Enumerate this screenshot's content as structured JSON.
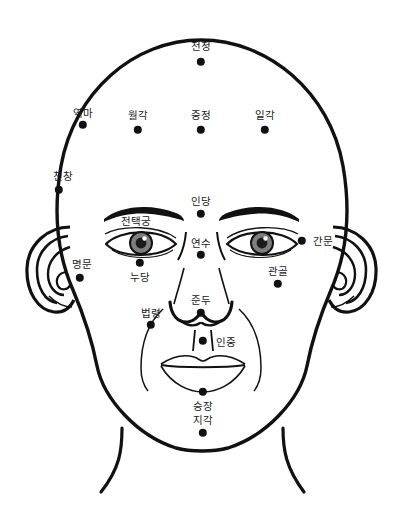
{
  "diagram": {
    "type": "anatomical-line-drawing",
    "canvas": {
      "width": 403,
      "height": 512
    },
    "colors": {
      "background": "#ffffff",
      "outline": "#111111",
      "dot": "#111111",
      "label_text": "#1a1a1a",
      "iris": "#7a7a7a",
      "pupil": "#1a1a1a"
    },
    "points": [
      {
        "id": "cheonjeong",
        "label": "천정",
        "dot": {
          "x": 201,
          "y": 62
        },
        "label_pos": {
          "x": 201,
          "y": 46
        },
        "radius": 4.2
      },
      {
        "id": "yeokma",
        "label": "역마",
        "dot": {
          "x": 83,
          "y": 125
        },
        "label_pos": {
          "x": 83,
          "y": 113
        },
        "radius": 4.2
      },
      {
        "id": "wolgak",
        "label": "월각",
        "dot": {
          "x": 138,
          "y": 130
        },
        "label_pos": {
          "x": 138,
          "y": 115
        },
        "radius": 4.2
      },
      {
        "id": "jungjeong",
        "label": "중정",
        "dot": {
          "x": 201,
          "y": 130
        },
        "label_pos": {
          "x": 201,
          "y": 115
        },
        "radius": 4.2
      },
      {
        "id": "ilgak",
        "label": "일각",
        "dot": {
          "x": 265,
          "y": 130
        },
        "label_pos": {
          "x": 265,
          "y": 115
        },
        "radius": 4.2
      },
      {
        "id": "cheonchang",
        "label": "천창",
        "dot": {
          "x": 59,
          "y": 190
        },
        "label_pos": {
          "x": 63,
          "y": 176
        },
        "radius": 4.2
      },
      {
        "id": "indang",
        "label": "인당",
        "dot": {
          "x": 201,
          "y": 214
        },
        "label_pos": {
          "x": 201,
          "y": 201
        },
        "radius": 4.2
      },
      {
        "id": "jeontaekgung",
        "label": "전택궁",
        "dot": null,
        "label_pos": {
          "x": 136,
          "y": 221
        },
        "radius": 0
      },
      {
        "id": "yeonsu",
        "label": "연수",
        "dot": {
          "x": 201,
          "y": 255
        },
        "label_pos": {
          "x": 201,
          "y": 243
        },
        "radius": 4.2
      },
      {
        "id": "ganmun",
        "label": "간문",
        "dot": {
          "x": 302,
          "y": 241
        },
        "label_pos": {
          "x": 323,
          "y": 241
        },
        "radius": 4.2
      },
      {
        "id": "myeongmun",
        "label": "명문",
        "dot": {
          "x": 80,
          "y": 278
        },
        "label_pos": {
          "x": 82,
          "y": 264
        },
        "radius": 4.2
      },
      {
        "id": "nudang",
        "label": "누당",
        "dot": {
          "x": 140,
          "y": 263
        },
        "label_pos": {
          "x": 140,
          "y": 277
        },
        "radius": 4.2
      },
      {
        "id": "gwangol",
        "label": "관골",
        "dot": {
          "x": 278,
          "y": 284
        },
        "label_pos": {
          "x": 278,
          "y": 271
        },
        "radius": 4.2
      },
      {
        "id": "jundu",
        "label": "준두",
        "dot": {
          "x": 201,
          "y": 313
        },
        "label_pos": {
          "x": 201,
          "y": 300
        },
        "radius": 4.2
      },
      {
        "id": "beopryeong",
        "label": "법령",
        "dot": {
          "x": 151,
          "y": 325
        },
        "label_pos": {
          "x": 151,
          "y": 313
        },
        "radius": 4.2
      },
      {
        "id": "injung",
        "label": "인중",
        "dot": {
          "x": 203,
          "y": 341
        },
        "label_pos": {
          "x": 226,
          "y": 342
        },
        "radius": 4.2
      },
      {
        "id": "seungjang",
        "label": "승장",
        "dot": {
          "x": 203,
          "y": 392
        },
        "label_pos": {
          "x": 203,
          "y": 406
        },
        "radius": 4.2
      },
      {
        "id": "jigak",
        "label": "지각",
        "dot": {
          "x": 203,
          "y": 433
        },
        "label_pos": {
          "x": 203,
          "y": 420
        },
        "radius": 4.2
      }
    ]
  }
}
